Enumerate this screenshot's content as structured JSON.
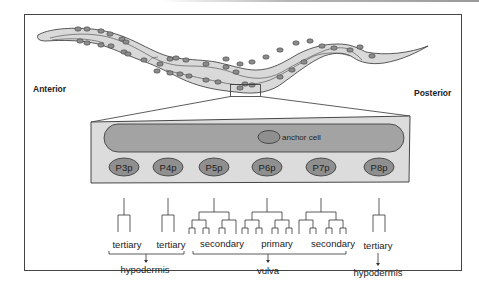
{
  "figure": {
    "orientation": {
      "anterior": "Anterior",
      "posterior": "Posterior"
    },
    "anchor_cell_label": "anchor cell",
    "precursor_cells": [
      {
        "name": "P3p",
        "fate": "tertiary",
        "tree": "tertiary"
      },
      {
        "name": "P4p",
        "fate": "tertiary",
        "tree": "tertiary"
      },
      {
        "name": "P5p",
        "fate": "secondary",
        "tree": "secondary-left"
      },
      {
        "name": "P6p",
        "fate": "primary",
        "tree": "primary"
      },
      {
        "name": "P7p",
        "fate": "secondary",
        "tree": "secondary-right"
      },
      {
        "name": "P8p",
        "fate": "tertiary",
        "tree": "tertiary"
      }
    ],
    "outcomes": [
      {
        "label": "hypodermis",
        "cells": [
          "P3p",
          "P4p"
        ]
      },
      {
        "label": "vulva",
        "cells": [
          "P5p",
          "P6p",
          "P7p"
        ]
      },
      {
        "label": "hypodermis",
        "cells": [
          "P8p"
        ]
      }
    ],
    "colors": {
      "worm_fill": "#d9d9d9",
      "nucleus_fill": "#8c8c8c",
      "panel_fill": "#dcdcdc",
      "gonad_fill": "#a3a3a3",
      "cell_fill": "#8f8f8f",
      "stroke": "#333333"
    }
  }
}
